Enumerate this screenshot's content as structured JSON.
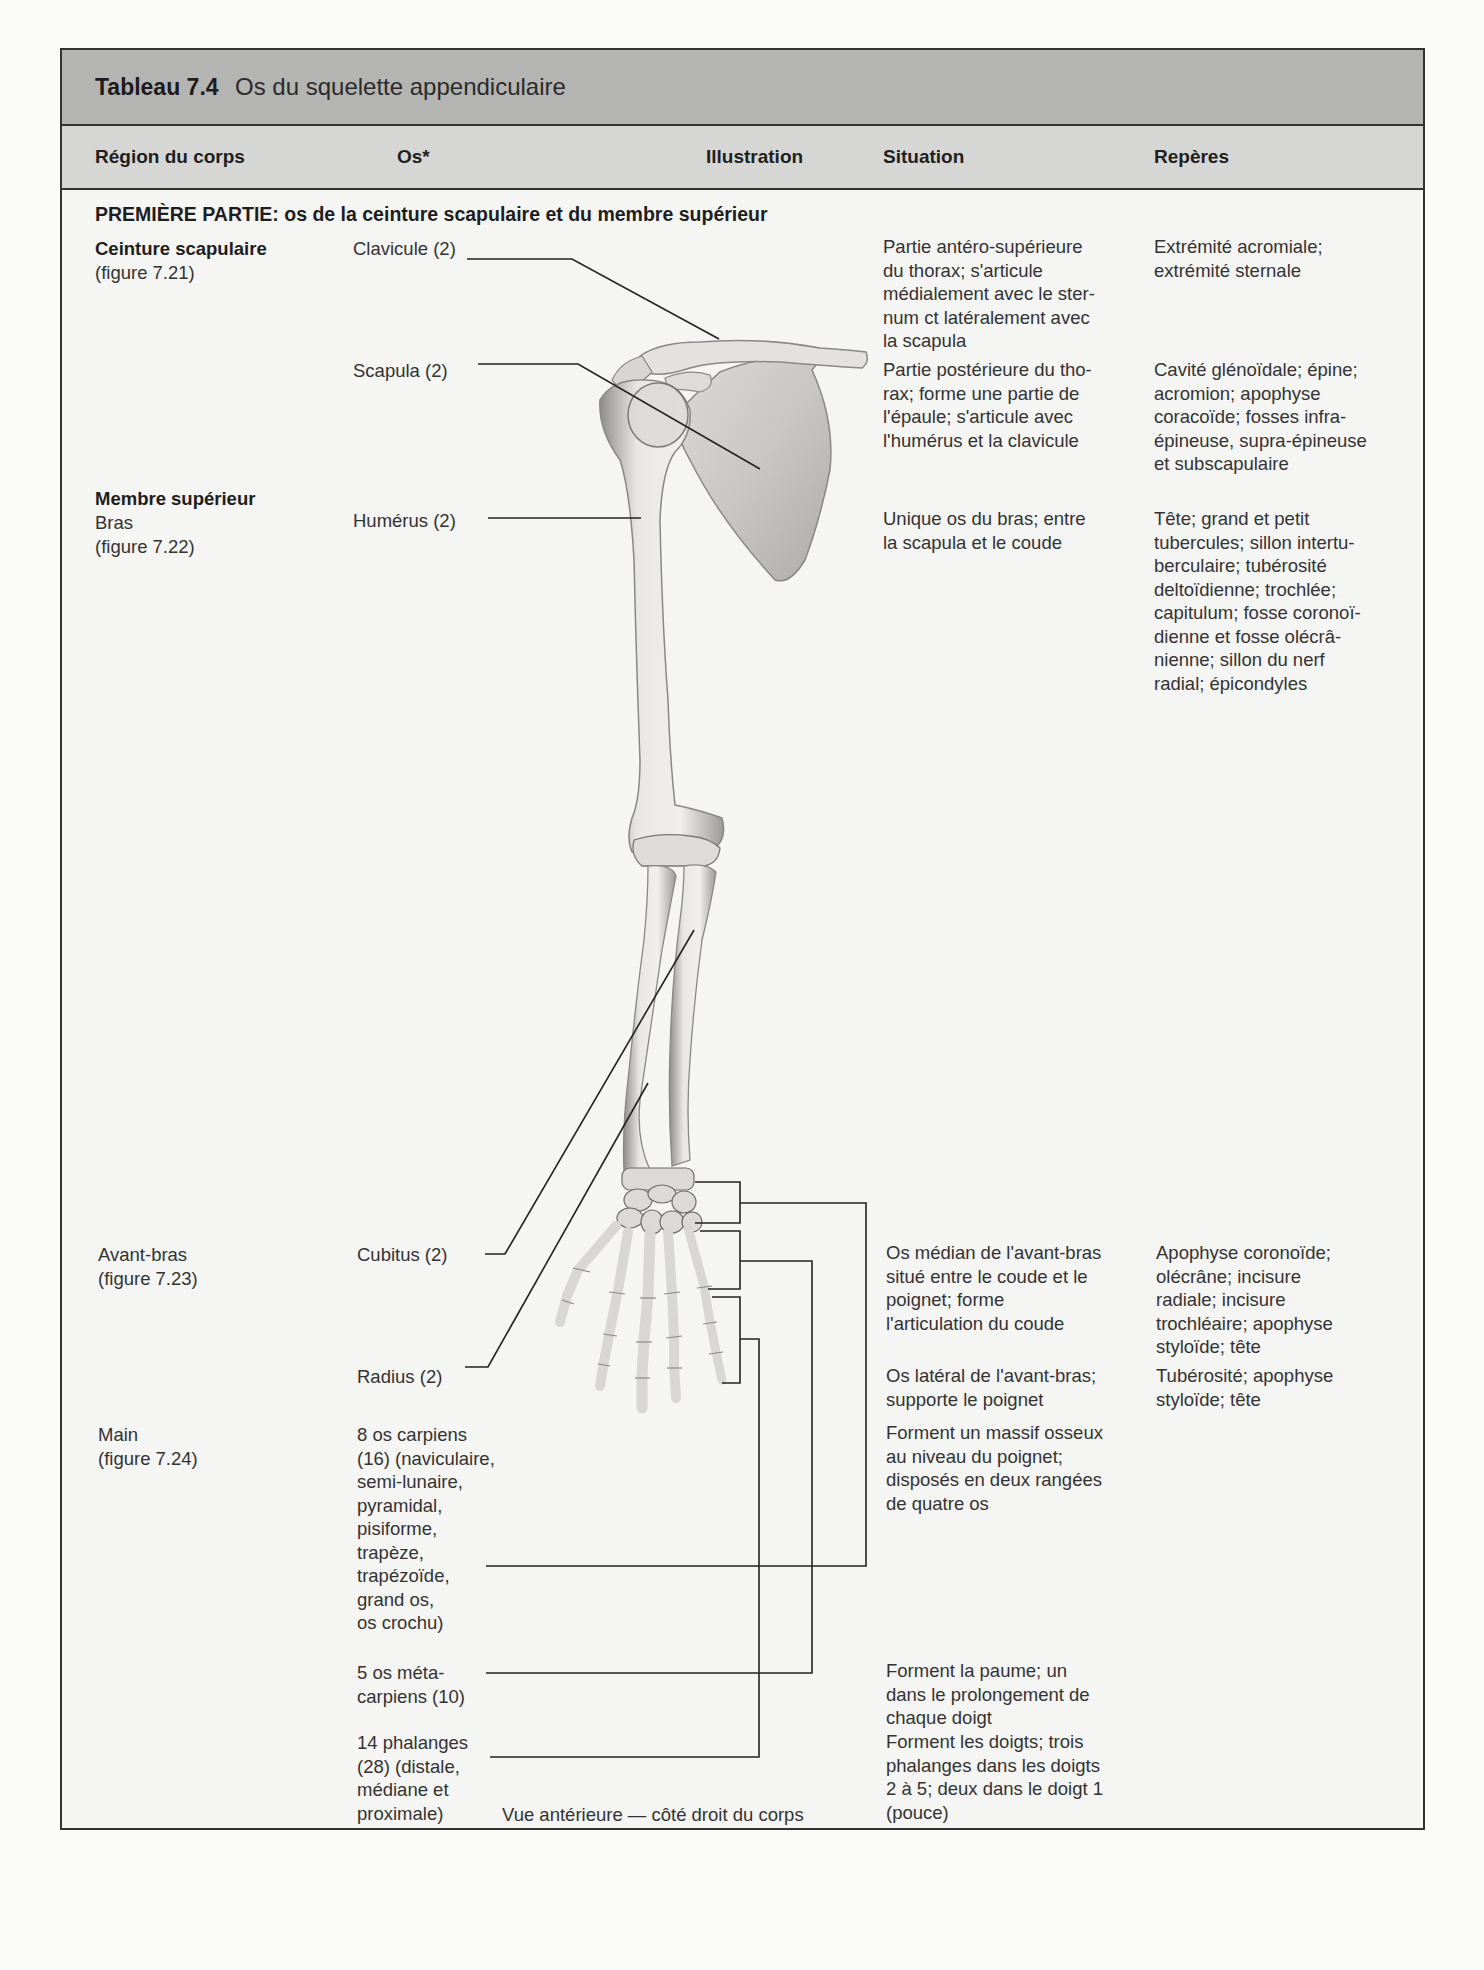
{
  "table": {
    "number": "Tableau 7.4",
    "title": "Os du squelette appendiculaire"
  },
  "headers": {
    "region": "Région du corps",
    "os": "Os*",
    "illustration": "Illustration",
    "situation": "Situation",
    "reperes": "Repères"
  },
  "section": {
    "title": "PREMIÈRE PARTIE: os de la ceinture scapulaire et du membre supérieur"
  },
  "regions": {
    "ceinture_title": "Ceinture scapulaire",
    "ceinture_fig": "(figure 7.21)",
    "membre_title": "Membre supérieur",
    "bras": "Bras",
    "bras_fig": "(figure 7.22)",
    "avant_bras": "Avant-bras",
    "avant_bras_fig": "(figure 7.23)",
    "main": "Main",
    "main_fig": "(figure 7.24)"
  },
  "bones": {
    "clavicule": "Clavicule (2)",
    "scapula": "Scapula (2)",
    "humerus": "Humérus (2)",
    "cubitus": "Cubitus (2)",
    "radius": "Radius (2)",
    "carpiens": "8 os carpiens\n(16) (naviculaire,\nsemi-lunaire,\npyramidal,\npisiforme,\ntrapèze,\ntrapézoïde,\ngrand os,\nos crochu)",
    "metacarpiens": "5 os méta-\ncarpiens (10)",
    "phalanges": "14 phalanges\n(28) (distale,\nmédiane et\nproximale)"
  },
  "situation": {
    "clavicule": "Partie antéro-supérieure\ndu thorax; s'articule\nmédialement avec le ster-\nnum ct latéralement avec\nla scapula",
    "scapula": "Partie postérieure du tho-\nrax; forme une partie de\nl'épaule; s'articule avec\nl'humérus et la clavicule",
    "humerus": "Unique os du bras; entre\nla scapula et le coude",
    "cubitus": "Os médian de l'avant-bras\nsitué entre le coude et le\npoignet; forme\nl'articulation du coude",
    "radius": "Os latéral de l'avant-bras;\nsupporte le poignet",
    "carpiens": "Forment un massif osseux\nau niveau du poignet;\ndisposés en deux rangées\nde quatre os",
    "metacarpiens": "Forment la paume; un\ndans le prolongement de\nchaque doigt",
    "phalanges": "Forment les doigts; trois\nphalanges dans les doigts\n2 à 5; deux dans le doigt 1\n(pouce)"
  },
  "reperes": {
    "clavicule": "Extrémité acromiale;\nextrémité sternale",
    "scapula": "Cavité glénoïdale; épine;\nacromion; apophyse\ncoracoïde; fosses infra-\népineuse, supra-épineuse\net subscapulaire",
    "humerus": "Tête; grand et petit\ntubercules; sillon intertu-\nberculaire; tubérosité\ndeltoïdienne; trochlée;\ncapitulum; fosse coronoï-\ndienne et fosse olécrâ-\nnienne; sillon du nerf\nradial; épicondyles",
    "cubitus": "Apophyse coronoïde;\nolécrâne; incisure\nradiale; incisure\ntrochléaire; apophyse\nstyloïde; tête",
    "radius": "Tubérosité; apophyse\nstyloïde; tête"
  },
  "illustration": {
    "caption": "Vue antérieure — côté droit du corps",
    "colors": {
      "bone_fill": "#e6e4e0",
      "bone_shade": "#9a9894",
      "leader_line": "#222222"
    }
  }
}
